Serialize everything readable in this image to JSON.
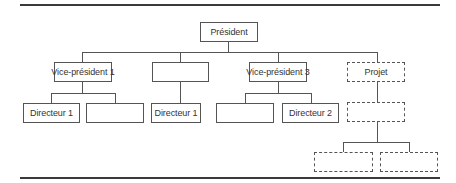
{
  "diagram": {
    "type": "org-chart",
    "root": {
      "label": "Président"
    },
    "level2": [
      {
        "label": "Vice-président 1",
        "style": "solid"
      },
      {
        "label": "",
        "style": "solid"
      },
      {
        "label": "Vice-président 3",
        "style": "solid"
      },
      {
        "label": "Projet",
        "style": "dashed"
      }
    ],
    "level3": {
      "vp1_children": [
        {
          "label": "Directeur 1",
          "style": "solid"
        },
        {
          "label": "",
          "style": "solid"
        }
      ],
      "blank_children": [
        {
          "label": "Directeur 1",
          "style": "solid"
        }
      ],
      "vp3_children": [
        {
          "label": "",
          "style": "solid"
        },
        {
          "label": "Directeur 2",
          "style": "solid"
        }
      ],
      "projet_children": [
        {
          "label": "",
          "style": "dashed"
        }
      ]
    },
    "level4": {
      "projet_sub_children": [
        {
          "label": "",
          "style": "dashed"
        },
        {
          "label": "",
          "style": "dashed"
        }
      ]
    }
  }
}
